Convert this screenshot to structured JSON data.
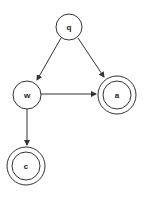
{
  "diagram": {
    "type": "state-machine",
    "nodes": [
      {
        "id": "q",
        "label": "q",
        "accepting": false,
        "cx": 69,
        "cy": 27
      },
      {
        "id": "w",
        "label": "w",
        "accepting": false,
        "cx": 27,
        "cy": 95
      },
      {
        "id": "a",
        "label": "a",
        "accepting": true,
        "cx": 117,
        "cy": 95
      },
      {
        "id": "c",
        "label": "c",
        "accepting": true,
        "cx": 26,
        "cy": 166
      }
    ],
    "edges": [
      {
        "from": "q",
        "to": "w"
      },
      {
        "from": "q",
        "to": "a"
      },
      {
        "from": "w",
        "to": "a"
      },
      {
        "from": "w",
        "to": "c"
      }
    ],
    "colors": {
      "stroke": "#333333",
      "background": "#ffffff"
    }
  }
}
